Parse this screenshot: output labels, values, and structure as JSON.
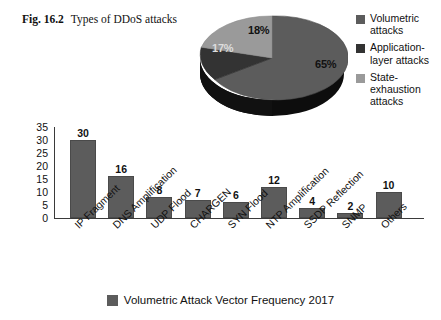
{
  "caption": {
    "figure_number": "Fig. 16.2",
    "text": "Types of DDoS attacks"
  },
  "pie_legend": {
    "items": [
      {
        "label": "Volumetric attacks",
        "color": "#5c5c5c",
        "swatch_name": "volumetric-swatch"
      },
      {
        "label": "Application-layer attacks",
        "color": "#333333",
        "swatch_name": "application-layer-swatch"
      },
      {
        "label": "State-exhaustion attacks",
        "color": "#9a9a9a",
        "swatch_name": "state-exhaustion-swatch"
      }
    ]
  },
  "bottom_legend": {
    "label": "Volumetric Attack Vector Frequency 2017",
    "color": "#5c5c5c"
  },
  "chart_data": [
    {
      "type": "pie",
      "title": "Types of DDoS attacks",
      "labels": [
        "Volumetric attacks",
        "Application-layer attacks",
        "State-exhaustion attacks"
      ],
      "values": [
        65,
        17,
        18
      ],
      "value_labels": [
        "65%",
        "17%",
        "18%"
      ],
      "colors": [
        "#5c5c5c",
        "#333333",
        "#9a9a9a"
      ],
      "legend_position": "right",
      "three_d": true,
      "units": "percent"
    },
    {
      "type": "bar",
      "title": "Volumetric Attack Vector Frequency 2017",
      "xlabel": "",
      "ylabel": "",
      "categories": [
        "IP Fragment",
        "DNS Amplification",
        "UDP Flood",
        "CHARGEN",
        "SYN Flood",
        "NTP Amplification",
        "SSDP Reflection",
        "SNMP",
        "Others"
      ],
      "values": [
        30,
        16,
        8,
        7,
        6,
        12,
        4,
        2,
        10
      ],
      "ylim": [
        0,
        35
      ],
      "yticks": [
        0,
        5,
        10,
        15,
        20,
        25,
        30,
        35
      ],
      "ytick_labels": [
        "0",
        "5",
        "10",
        "15",
        "20",
        "25",
        "30",
        "35"
      ],
      "grid": false,
      "legend_position": "bottom",
      "bar_color": "#5c5c5c",
      "show_value_labels": true
    }
  ]
}
